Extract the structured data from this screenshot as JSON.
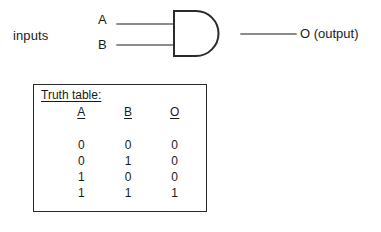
{
  "diagram": {
    "colors": {
      "ink": "#1a1a1a",
      "line": "#555555",
      "gate_stroke": "#2b2b2b",
      "background": "#ffffff"
    },
    "circuit": {
      "inputs_label": "inputs",
      "input_a_label": "A",
      "input_b_label": "B",
      "output_label": "O (output)",
      "gate_type": "and-gate"
    },
    "truth_table": {
      "title": "Truth table:",
      "headers": [
        "A",
        "B",
        "O"
      ],
      "rows": [
        [
          "0",
          "0",
          "0"
        ],
        [
          "0",
          "1",
          "0"
        ],
        [
          "1",
          "0",
          "0"
        ],
        [
          "1",
          "1",
          "1"
        ]
      ]
    }
  }
}
